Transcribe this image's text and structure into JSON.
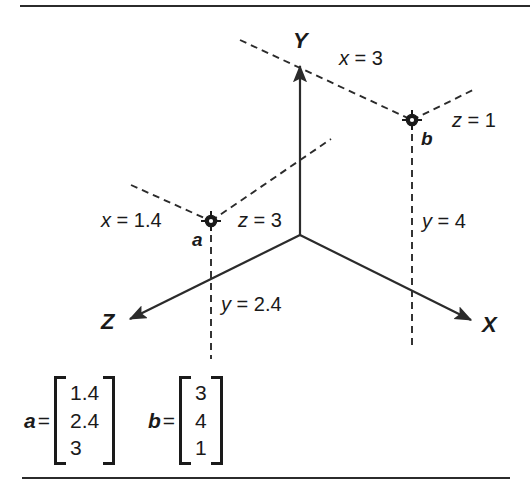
{
  "figure": {
    "kind": "3d-coordinate-diagram",
    "background_color": "#ffffff",
    "ink_color": "#1a1a1a",
    "rule_color": "#2b2b2b"
  },
  "axes": [
    {
      "id": "y",
      "label": "Y"
    },
    {
      "id": "x",
      "label": "X"
    },
    {
      "id": "z",
      "label": "Z"
    }
  ],
  "points": [
    {
      "id": "a",
      "label": "a"
    },
    {
      "id": "b",
      "label": "b"
    }
  ],
  "coordinate_labels": [
    {
      "id": "x3",
      "text": "x = 3",
      "var": "x",
      "value": "3",
      "point": "b"
    },
    {
      "id": "z1",
      "text": "z = 1",
      "var": "z",
      "value": "1",
      "point": "b"
    },
    {
      "id": "y4",
      "text": "y = 4",
      "var": "y",
      "value": "4",
      "point": "b"
    },
    {
      "id": "x14",
      "text": "x = 1.4",
      "var": "x",
      "value": "1.4",
      "point": "a"
    },
    {
      "id": "z3",
      "text": "z = 3",
      "var": "z",
      "value": "3",
      "point": "a"
    },
    {
      "id": "y24",
      "text": "y = 2.4",
      "var": "y",
      "value": "2.4",
      "point": "a"
    }
  ],
  "matrices": [
    {
      "id": "vector-a",
      "name": "a",
      "equals": "=",
      "values": [
        "1.4",
        "2.4",
        "3"
      ]
    },
    {
      "id": "vector-b",
      "name": "b",
      "equals": "=",
      "values": [
        "3",
        "4",
        "1"
      ]
    }
  ],
  "chart_data": {
    "type": "scatter",
    "title": "",
    "xlabel": "X",
    "ylabel": "Y",
    "zlabel": "Z",
    "series": [
      {
        "name": "a",
        "x": 1.4,
        "y": 2.4,
        "z": 3
      },
      {
        "name": "b",
        "x": 3,
        "y": 4,
        "z": 1
      }
    ],
    "grid": false,
    "legend": "none"
  }
}
